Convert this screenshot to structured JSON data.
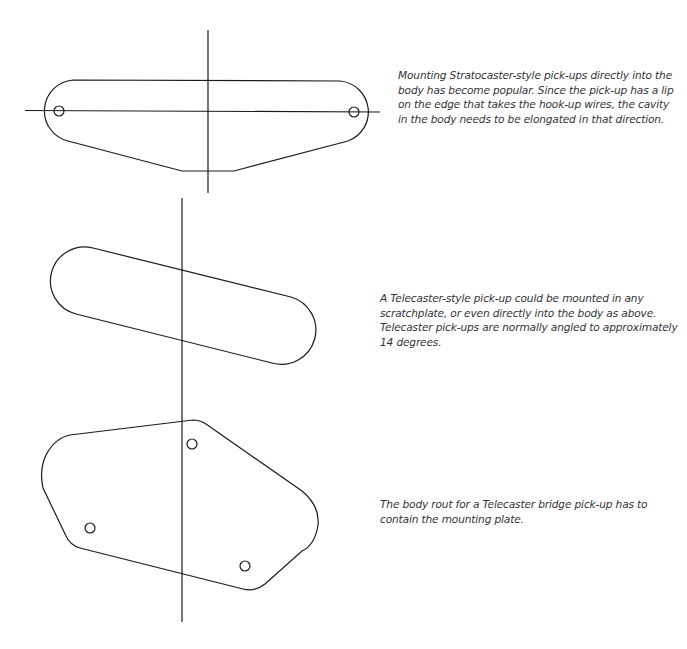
{
  "captions": {
    "strat": "Mounting Stratocaster-style pick-ups directly into the\nbody has become popular. Since the pick-up has a lip\non the edge that takes the hook-up wires, the cavity\nin the body needs to be elongated in that direction.",
    "tele_neck": "A Telecaster-style pick-up could be mounted in any\nscratchplate, or even directly into the body as above.\nTelecaster pick-ups are normally angled to approximately\n14 degrees.",
    "tele_bridge": "The body rout for a Telecaster bridge pick-up has to\ncontain the mounting plate."
  },
  "figures": [
    {
      "id": "stratocaster-pickup-outline",
      "label": "Stratocaster pick-up with lip"
    },
    {
      "id": "telecaster-neck-pickup-outline",
      "label": "Telecaster pick-up angled",
      "angle_degrees": 14
    },
    {
      "id": "telecaster-bridge-plate-outline",
      "label": "Telecaster bridge pick-up mounting plate"
    }
  ],
  "colors": {
    "line": "#1a1a1a",
    "text": "#333333",
    "background": "#ffffff"
  }
}
